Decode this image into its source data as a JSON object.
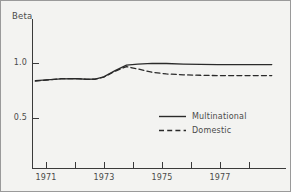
{
  "chart_data": {
    "type": "line",
    "title": "",
    "subtitle": "",
    "ylabel": "Beta",
    "xlabel": "",
    "xlim": [
      1970.5,
      1979.4
    ],
    "ylim": [
      0.0,
      1.32
    ],
    "grid": false,
    "legend_position": "center-right",
    "y_ticks": [
      {
        "value": 1.0,
        "label": "1.0"
      },
      {
        "value": 0.5,
        "label": "0.5"
      }
    ],
    "x_ticks": [
      {
        "value": 1970.5,
        "label": ""
      },
      {
        "value": 1971.0,
        "label": "1971"
      },
      {
        "value": 1972.0,
        "label": ""
      },
      {
        "value": 1973.0,
        "label": "1973"
      },
      {
        "value": 1974.0,
        "label": ""
      },
      {
        "value": 1975.0,
        "label": "1975"
      },
      {
        "value": 1976.0,
        "label": ""
      },
      {
        "value": 1977.0,
        "label": "1977"
      }
    ],
    "x": [
      1970.6,
      1971.0,
      1971.5,
      1972.0,
      1972.4,
      1972.7,
      1973.0,
      1973.4,
      1973.8,
      1974.2,
      1974.7,
      1975.2,
      1975.8,
      1976.4,
      1977.0,
      1977.6,
      1978.2,
      1978.9
    ],
    "series": [
      {
        "name": "Multinational",
        "style": "solid",
        "color": "#2a2a2a",
        "values": [
          0.845,
          0.852,
          0.861,
          0.862,
          0.857,
          0.858,
          0.878,
          0.935,
          0.985,
          0.995,
          1.002,
          1.0,
          0.995,
          0.992,
          0.99,
          0.99,
          0.99,
          0.99
        ]
      },
      {
        "name": "Domestic",
        "style": "dashed",
        "color": "#2a2a2a",
        "values": [
          0.84,
          0.85,
          0.862,
          0.863,
          0.856,
          0.857,
          0.876,
          0.93,
          0.972,
          0.95,
          0.92,
          0.905,
          0.897,
          0.893,
          0.89,
          0.89,
          0.89,
          0.89
        ]
      }
    ]
  },
  "legend": {
    "entries": [
      {
        "label": "Multinational",
        "style": "solid"
      },
      {
        "label": "Domestic",
        "style": "dashed"
      }
    ]
  }
}
